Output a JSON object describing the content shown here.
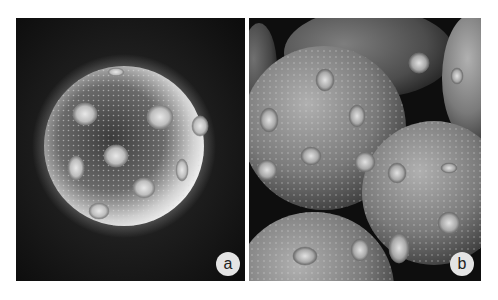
{
  "figure": {
    "panels": [
      {
        "id": "a",
        "label": "a",
        "content": "single spherical pollen grain with multiple pores on dark background"
      },
      {
        "id": "b",
        "label": "b",
        "content": "cluster of several spherical pollen grains, close-up"
      }
    ],
    "colors": {
      "background": "#ffffff",
      "micrograph_dark": "#111111",
      "grain_light": "#d8d8d8",
      "label_circle": "#e4e4e4",
      "label_text": "#222222"
    }
  }
}
